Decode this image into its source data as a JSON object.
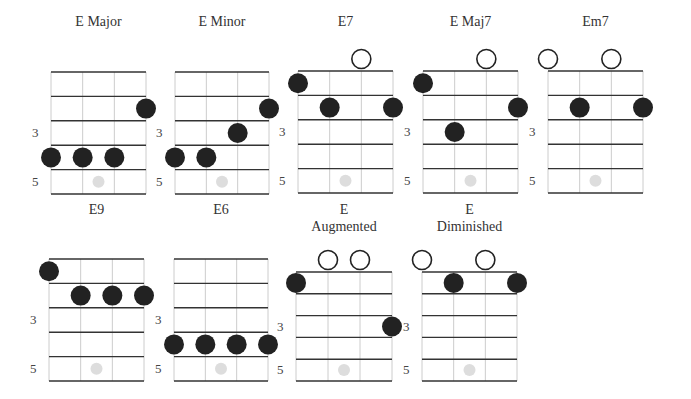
{
  "colors": {
    "grid_line": "#333333",
    "string_line": "#cccccc",
    "finger_dot": "#222222",
    "open_circle": "#222222",
    "marker_dot": "#dddddd",
    "text": "#333333"
  },
  "fret_labels": [
    "3",
    "5"
  ],
  "chords": [
    {
      "name": "E Major",
      "title_lines": [
        "E Major"
      ],
      "grid": {
        "left": 51,
        "top": 72,
        "width": 95,
        "fret_h": 24.4
      },
      "title_y": 22,
      "open": [],
      "dots": [
        [
          3,
          2
        ],
        [
          0,
          4
        ],
        [
          1,
          4
        ],
        [
          2,
          4
        ]
      ]
    },
    {
      "name": "E Minor",
      "title_lines": [
        "E Minor"
      ],
      "grid": {
        "left": 175,
        "top": 72,
        "width": 94,
        "fret_h": 24.4
      },
      "title_y": 22,
      "open": [],
      "dots": [
        [
          3,
          2
        ],
        [
          2,
          3
        ],
        [
          0,
          4
        ],
        [
          1,
          4
        ]
      ]
    },
    {
      "name": "E7",
      "title_lines": [
        "E7"
      ],
      "grid": {
        "left": 298,
        "top": 71,
        "width": 95,
        "fret_h": 24.4
      },
      "title_y": 22,
      "open": [
        2
      ],
      "dots": [
        [
          0,
          1
        ],
        [
          1,
          2
        ],
        [
          3,
          2
        ]
      ]
    },
    {
      "name": "E Maj7",
      "title_lines": [
        "E Maj7"
      ],
      "grid": {
        "left": 423,
        "top": 71,
        "width": 95,
        "fret_h": 24.4
      },
      "title_y": 22,
      "open": [
        2
      ],
      "dots": [
        [
          0,
          1
        ],
        [
          3,
          2
        ],
        [
          1,
          3
        ]
      ]
    },
    {
      "name": "Em7",
      "title_lines": [
        "Em7"
      ],
      "grid": {
        "left": 548,
        "top": 71,
        "width": 95,
        "fret_h": 24.4
      },
      "title_y": 22,
      "open": [
        0,
        2
      ],
      "dots": [
        [
          1,
          2
        ],
        [
          3,
          2
        ]
      ]
    },
    {
      "name": "E9",
      "title_lines": [
        "E9"
      ],
      "grid": {
        "left": 49,
        "top": 259,
        "width": 95,
        "fret_h": 24.4
      },
      "title_y": 210,
      "open": [],
      "dots": [
        [
          0,
          1
        ],
        [
          1,
          2
        ],
        [
          2,
          2
        ],
        [
          3,
          2
        ]
      ]
    },
    {
      "name": "E6",
      "title_lines": [
        "E6"
      ],
      "grid": {
        "left": 174,
        "top": 259,
        "width": 94,
        "fret_h": 24.4
      },
      "title_y": 210,
      "open": [],
      "dots": [
        [
          0,
          4
        ],
        [
          1,
          4
        ],
        [
          2,
          4
        ],
        [
          3,
          4
        ]
      ]
    },
    {
      "name": "E Augmented",
      "title_lines": [
        "E",
        "Augmented"
      ],
      "grid": {
        "left": 296,
        "top": 272,
        "width": 96,
        "fret_h": 21.8
      },
      "title_y": 210,
      "open": [
        1,
        2
      ],
      "dots": [
        [
          0,
          1
        ],
        [
          3,
          3
        ]
      ]
    },
    {
      "name": "E Diminished",
      "title_lines": [
        "E",
        "Diminished"
      ],
      "grid": {
        "left": 422,
        "top": 272,
        "width": 95,
        "fret_h": 21.8
      },
      "title_y": 210,
      "open": [
        0,
        2
      ],
      "dots": [
        [
          1,
          1
        ],
        [
          3,
          1
        ]
      ]
    }
  ]
}
